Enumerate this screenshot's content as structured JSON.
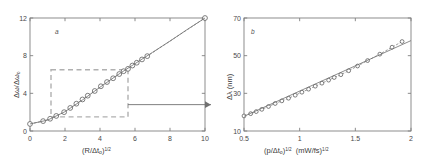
{
  "figure": {
    "background": "#ffffff",
    "axis_color": "#808080",
    "marker_edge_color": "#555555",
    "line_color": "#6e6e6e",
    "dashed_box_color": "#b0b0b0",
    "arrow_color": "#707070"
  },
  "panel_a": {
    "letter": "a",
    "xlabel_main": "(R/Δt",
    "xlabel_sub": "o",
    "xlabel_close": ")",
    "xlabel_exp": "1/2",
    "ylabel_main": "Δω/Δω",
    "ylabel_sub": "o",
    "xticks": [
      "0",
      "2",
      "4",
      "6",
      "8",
      "10"
    ],
    "yticks": [
      "0",
      "4",
      "8",
      "12"
    ],
    "xlim": [
      0,
      10
    ],
    "ylim": [
      0,
      12
    ],
    "inset_box": {
      "x0": 1.2,
      "x1": 5.6,
      "y0": 1.5,
      "y1": 6.5
    }
  },
  "panel_b": {
    "letter": "b",
    "xlabel_main": "(p/Δt",
    "xlabel_sub": "o",
    "xlabel_close": ")",
    "xlabel_exp": "1/2",
    "xlabel_units_open": "(mW/fs)",
    "xlabel_units_exp": "1/2",
    "ylabel_main": "Δλ  (nm)",
    "xticks": [
      "0.5",
      "1",
      "1.5",
      "2"
    ],
    "yticks": [
      "10",
      "30",
      "50",
      "70"
    ],
    "xlim": [
      0.5,
      2
    ],
    "ylim": [
      10,
      70
    ]
  },
  "chart_data": [
    {
      "type": "scatter",
      "id": "panel-a",
      "title": "a",
      "xlabel": "(R/Δt_o)^1/2",
      "ylabel": "Δω/Δω_o",
      "xlim": [
        0,
        10
      ],
      "ylim": [
        0,
        12
      ],
      "xticks": [
        0,
        2,
        4,
        6,
        8,
        10
      ],
      "yticks": [
        0,
        4,
        8,
        12
      ],
      "grid": false,
      "legend": "none",
      "series": [
        {
          "name": "measured",
          "marker": "circle-open",
          "x": [
            0.0,
            0.75,
            1.15,
            1.5,
            1.95,
            2.3,
            2.65,
            3.0,
            3.3,
            3.7,
            4.05,
            4.4,
            4.75,
            5.1,
            5.35,
            5.6,
            5.85,
            6.1,
            6.4,
            6.7,
            10.0
          ],
          "y": [
            0.75,
            1.05,
            1.3,
            1.6,
            2.0,
            2.45,
            2.9,
            3.35,
            3.75,
            4.25,
            4.75,
            5.2,
            5.6,
            6.05,
            6.35,
            6.6,
            6.95,
            7.25,
            7.6,
            7.95,
            12.0
          ]
        },
        {
          "name": "fit",
          "marker": "line",
          "x": [
            0.0,
            1.0,
            2.0,
            3.0,
            4.0,
            5.0,
            6.0,
            7.0,
            8.0,
            9.0,
            10.0
          ],
          "y": [
            0.75,
            1.15,
            2.05,
            3.3,
            4.65,
            5.95,
            7.15,
            8.35,
            9.55,
            10.8,
            12.0
          ]
        }
      ],
      "annotations": [
        {
          "kind": "dashed-rect",
          "x0": 1.2,
          "x1": 5.6,
          "y0": 1.5,
          "y1": 6.5
        },
        {
          "kind": "arrow",
          "from_x": 5.6,
          "from_y": 2.8,
          "to_panel": "panel-b"
        }
      ]
    },
    {
      "type": "scatter",
      "id": "panel-b",
      "title": "b",
      "xlabel": "(p/Δt_o)^1/2  (mW/fs)^1/2",
      "ylabel": "Δλ  (nm)",
      "xlim": [
        0.5,
        2.0
      ],
      "ylim": [
        10,
        70
      ],
      "xticks": [
        0.5,
        1.0,
        1.5,
        2.0
      ],
      "yticks": [
        10,
        30,
        50,
        70
      ],
      "grid": false,
      "legend": "none",
      "series": [
        {
          "name": "measured",
          "marker": "circle-open",
          "x": [
            0.5,
            0.56,
            0.61,
            0.66,
            0.72,
            0.78,
            0.84,
            0.9,
            0.96,
            1.02,
            1.08,
            1.14,
            1.2,
            1.26,
            1.31,
            1.37,
            1.44,
            1.52,
            1.61,
            1.72,
            1.83,
            1.92
          ],
          "y": [
            18.0,
            19.2,
            20.3,
            21.5,
            23.0,
            24.6,
            26.0,
            27.4,
            29.0,
            30.6,
            32.2,
            33.8,
            35.4,
            37.0,
            38.4,
            39.9,
            42.0,
            44.5,
            47.4,
            50.8,
            54.5,
            57.5
          ]
        },
        {
          "name": "fit",
          "marker": "line",
          "x": [
            0.5,
            2.0
          ],
          "y": [
            17.8,
            58.0
          ]
        }
      ],
      "annotations": []
    }
  ]
}
